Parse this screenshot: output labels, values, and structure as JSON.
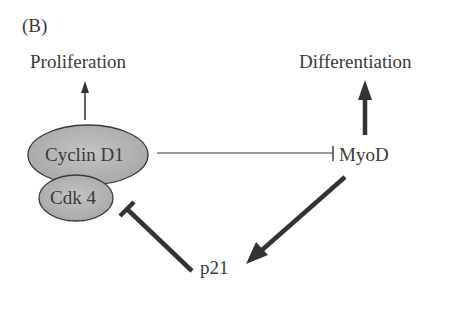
{
  "panel_label": "(B)",
  "nodes": {
    "proliferation": "Proliferation",
    "differentiation": "Differentiation",
    "cyclin_d1": "Cyclin D1",
    "cdk4": "Cdk 4",
    "myod": "MyoD",
    "p21": "p21"
  },
  "edges": [
    {
      "from": "Cyclin D1",
      "to": "Proliferation",
      "type": "activation",
      "weight": "thin"
    },
    {
      "from": "Cyclin D1",
      "to": "MyoD",
      "type": "inhibition",
      "weight": "thin"
    },
    {
      "from": "MyoD",
      "to": "Differentiation",
      "type": "activation",
      "weight": "thick"
    },
    {
      "from": "MyoD",
      "to": "p21",
      "type": "activation",
      "weight": "thick"
    },
    {
      "from": "p21",
      "to": "Cdk 4",
      "type": "inhibition",
      "weight": "thick"
    }
  ],
  "colors": {
    "ellipse_fill": "#b3b3b3",
    "ellipse_stroke": "#3a3a3a",
    "line": "#333333",
    "text": "#3a3a3a"
  }
}
